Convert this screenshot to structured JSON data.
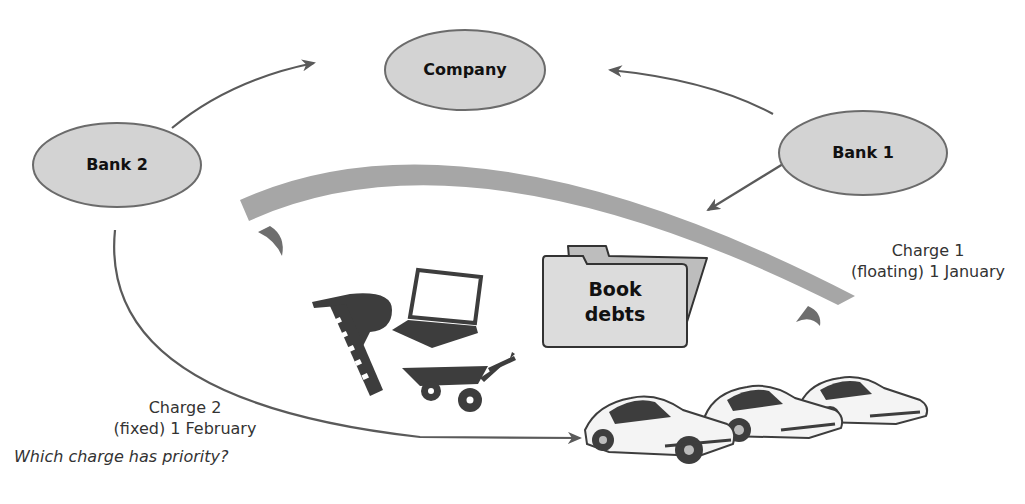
{
  "nodes": {
    "company": {
      "label": "Company"
    },
    "bank1": {
      "label": "Bank 1"
    },
    "bank2": {
      "label": "Bank 2"
    }
  },
  "assets": {
    "book_debts": {
      "line1": "Book",
      "line2": "debts"
    },
    "icons": [
      "nail-gun-icon",
      "laptop-icon",
      "wheelbarrow-icon",
      "car-icon",
      "car-icon",
      "car-icon"
    ]
  },
  "charges": {
    "charge1": {
      "line1": "Charge 1",
      "line2": "(floating) 1 January"
    },
    "charge2": {
      "line1": "Charge 2",
      "line2": "(fixed) 1 February"
    }
  },
  "question": "Which charge has priority?",
  "colors": {
    "node_fill": "#d3d3d3",
    "node_stroke": "#6b6b6b",
    "band": "#a6a6a6",
    "arrow": "#5a5a5a",
    "silhouette": "#3d3d3d"
  }
}
